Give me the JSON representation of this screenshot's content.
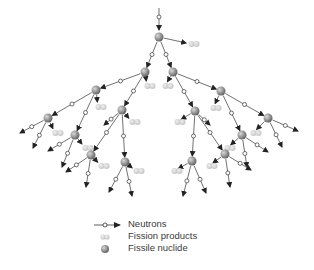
{
  "diagram": {
    "title": "",
    "colors": {
      "line": "#333333",
      "nucleus_light": "#c8c8c8",
      "nucleus_dark": "#6e6e6e",
      "fission": "#d8d8d8"
    },
    "incoming": {
      "from": [
        159,
        8
      ],
      "to": [
        159,
        30
      ]
    },
    "nuclei": [
      {
        "id": 0,
        "x": 159,
        "y": 37,
        "parent": null,
        "fp": [
          194,
          44
        ]
      },
      {
        "id": 1,
        "x": 145,
        "y": 72,
        "parent": 0,
        "fp": [
          150,
          86
        ]
      },
      {
        "id": 2,
        "x": 173,
        "y": 72,
        "parent": 0,
        "fp": [
          168,
          86
        ]
      },
      {
        "id": 3,
        "x": 96,
        "y": 90,
        "parent": 1,
        "fp": [
          101,
          107
        ]
      },
      {
        "id": 4,
        "x": 122,
        "y": 110,
        "parent": 1,
        "fp": [
          135,
          122
        ]
      },
      {
        "id": 5,
        "x": 221,
        "y": 91,
        "parent": 2,
        "fp": [
          216,
          108
        ]
      },
      {
        "id": 6,
        "x": 195,
        "y": 111,
        "parent": 2,
        "fp": [
          180,
          122
        ]
      },
      {
        "id": 7,
        "x": 48,
        "y": 118,
        "parent": 3,
        "fp": [
          58,
          133
        ]
      },
      {
        "id": 8,
        "x": 75,
        "y": 135,
        "parent": 3,
        "fp": [
          88,
          148
        ]
      },
      {
        "id": 9,
        "x": 268,
        "y": 118,
        "parent": 5,
        "fp": [
          256,
          133
        ]
      },
      {
        "id": 10,
        "x": 242,
        "y": 135,
        "parent": 5,
        "fp": [
          230,
          148
        ]
      },
      {
        "id": 11,
        "x": 91,
        "y": 155,
        "parent": 4,
        "fp": [
          104,
          166
        ]
      },
      {
        "id": 12,
        "x": 125,
        "y": 162,
        "parent": 4,
        "fp": [
          139,
          171
        ]
      },
      {
        "id": 13,
        "x": 225,
        "y": 154,
        "parent": 6,
        "fp": [
          212,
          166
        ]
      },
      {
        "id": 14,
        "x": 192,
        "y": 161,
        "parent": 6,
        "fp": [
          177,
          171
        ]
      }
    ],
    "leaf_arrows": [
      {
        "from": 7,
        "to": [
          20,
          133
        ]
      },
      {
        "from": 7,
        "to": [
          33,
          148
        ]
      },
      {
        "from": 8,
        "to": [
          48,
          151
        ]
      },
      {
        "from": 8,
        "to": [
          62,
          167
        ]
      },
      {
        "from": 11,
        "to": [
          66,
          172
        ]
      },
      {
        "from": 11,
        "to": [
          86,
          187
        ]
      },
      {
        "from": 12,
        "to": [
          109,
          192
        ]
      },
      {
        "from": 12,
        "to": [
          132,
          196
        ]
      },
      {
        "from": 14,
        "to": [
          183,
          196
        ]
      },
      {
        "from": 14,
        "to": [
          206,
          193
        ]
      },
      {
        "from": 13,
        "to": [
          230,
          187
        ]
      },
      {
        "from": 13,
        "to": [
          251,
          170
        ]
      },
      {
        "from": 10,
        "to": [
          247,
          167
        ]
      },
      {
        "from": 10,
        "to": [
          268,
          152
        ]
      },
      {
        "from": 9,
        "to": [
          282,
          147
        ]
      },
      {
        "from": 9,
        "to": [
          298,
          131
        ]
      },
      {
        "from": 4,
        "to": [
          104,
          125
        ]
      },
      {
        "from": 6,
        "to": [
          210,
          125
        ]
      }
    ]
  },
  "legend": {
    "items": [
      {
        "symbol": "neutron-arrow",
        "label": "Neutrons"
      },
      {
        "symbol": "fission-products",
        "label": "Fission products"
      },
      {
        "symbol": "fissile-nuclide",
        "label": "Fissile nuclide"
      }
    ]
  }
}
